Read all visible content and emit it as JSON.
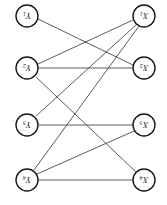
{
  "figure": {
    "width": 167,
    "height": 205,
    "rotation_degrees": 180,
    "background_color": "#ffffff",
    "node_stroke_color": "#1a1a1a",
    "edge_stroke_color": "#4a4a4a",
    "label_color": "#2b2b2b",
    "node_radius": 11
  },
  "left_column": {
    "name": "Y",
    "x": 27,
    "nodes": [
      {
        "id": "y1",
        "label": "Y",
        "subscript": "1",
        "cx": 27,
        "cy": 16
      },
      {
        "id": "y2",
        "label": "Y",
        "subscript": "2",
        "cx": 27,
        "cy": 68
      },
      {
        "id": "y3",
        "label": "Y",
        "subscript": "3",
        "cx": 27,
        "cy": 125
      },
      {
        "id": "y4",
        "label": "Y",
        "subscript": "4",
        "cx": 27,
        "cy": 180
      }
    ]
  },
  "right_column": {
    "name": "X",
    "x": 144,
    "nodes": [
      {
        "id": "x1",
        "label": "X",
        "subscript": "1",
        "cx": 144,
        "cy": 16
      },
      {
        "id": "x2",
        "label": "X",
        "subscript": "2",
        "cx": 144,
        "cy": 68
      },
      {
        "id": "x3",
        "label": "X",
        "subscript": "3",
        "cx": 144,
        "cy": 125
      },
      {
        "id": "x4",
        "label": "X",
        "subscript": "4",
        "cx": 144,
        "cy": 180
      }
    ]
  },
  "edges": [
    {
      "id": "e1",
      "from": "y1",
      "to": "x2",
      "x1": 38,
      "y1": 19,
      "x2": 133,
      "y2": 65
    },
    {
      "id": "e2",
      "from": "y2",
      "to": "x1",
      "x1": 38,
      "y1": 64,
      "x2": 133,
      "y2": 20
    },
    {
      "id": "e3",
      "from": "y2",
      "to": "x2",
      "x1": 38,
      "y1": 68,
      "x2": 133,
      "y2": 68
    },
    {
      "id": "e4",
      "from": "y2",
      "to": "x4",
      "x1": 36,
      "y1": 77,
      "x2": 136,
      "y2": 172
    },
    {
      "id": "e5",
      "from": "y3",
      "to": "x1",
      "x1": 36,
      "y1": 116,
      "x2": 137,
      "y2": 24
    },
    {
      "id": "e6",
      "from": "y3",
      "to": "x3",
      "x1": 38,
      "y1": 125,
      "x2": 133,
      "y2": 125
    },
    {
      "id": "e7",
      "from": "y4",
      "to": "x1",
      "x1": 34,
      "y1": 170,
      "x2": 139,
      "y2": 26
    },
    {
      "id": "e8",
      "from": "y4",
      "to": "x3",
      "x1": 37,
      "y1": 174,
      "x2": 134,
      "y2": 131
    },
    {
      "id": "e9",
      "from": "y4",
      "to": "x4",
      "x1": 38,
      "y1": 180,
      "x2": 133,
      "y2": 180
    }
  ]
}
